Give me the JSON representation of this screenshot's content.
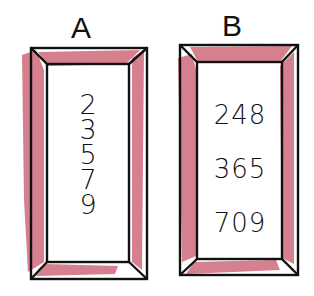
{
  "colors": {
    "frame_stroke": "#111111",
    "frame_fill": "#d06a7c",
    "background": "#ffffff"
  },
  "frames": [
    {
      "label": "A",
      "numbers": [
        "2",
        "3",
        "5",
        "7",
        "9"
      ]
    },
    {
      "label": "B",
      "numbers": [
        "248",
        "365",
        "709"
      ]
    }
  ]
}
